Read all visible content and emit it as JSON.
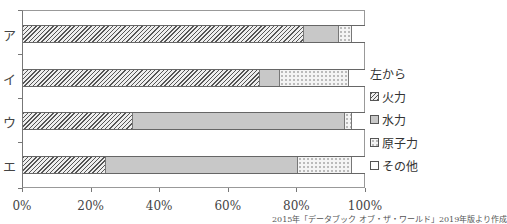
{
  "chart_data": {
    "type": "bar",
    "orientation": "horizontal",
    "stacked": true,
    "categories": [
      "ア",
      "イ",
      "ウ",
      "エ"
    ],
    "series": [
      {
        "name": "火力",
        "values": [
          82,
          69,
          32,
          24
        ],
        "pattern": "hatched"
      },
      {
        "name": "水力",
        "values": [
          10,
          6,
          62,
          56
        ],
        "pattern": "gray"
      },
      {
        "name": "原子力",
        "values": [
          4,
          20,
          2,
          16
        ],
        "pattern": "dotted"
      },
      {
        "name": "その他",
        "values": [
          4,
          5,
          4,
          4
        ],
        "pattern": "white"
      }
    ],
    "x_ticks": [
      "0%",
      "20%",
      "40%",
      "60%",
      "80%",
      "100%"
    ],
    "xlim": [
      0,
      100
    ],
    "legend_title": "左から",
    "legend_position": "right",
    "grid": false,
    "source": "2015年「データブック オブ・ザ・ワールド」2019年版より作成"
  },
  "legend": {
    "title": "左から",
    "items": [
      "火力",
      "水力",
      "原子力",
      "その他"
    ]
  }
}
